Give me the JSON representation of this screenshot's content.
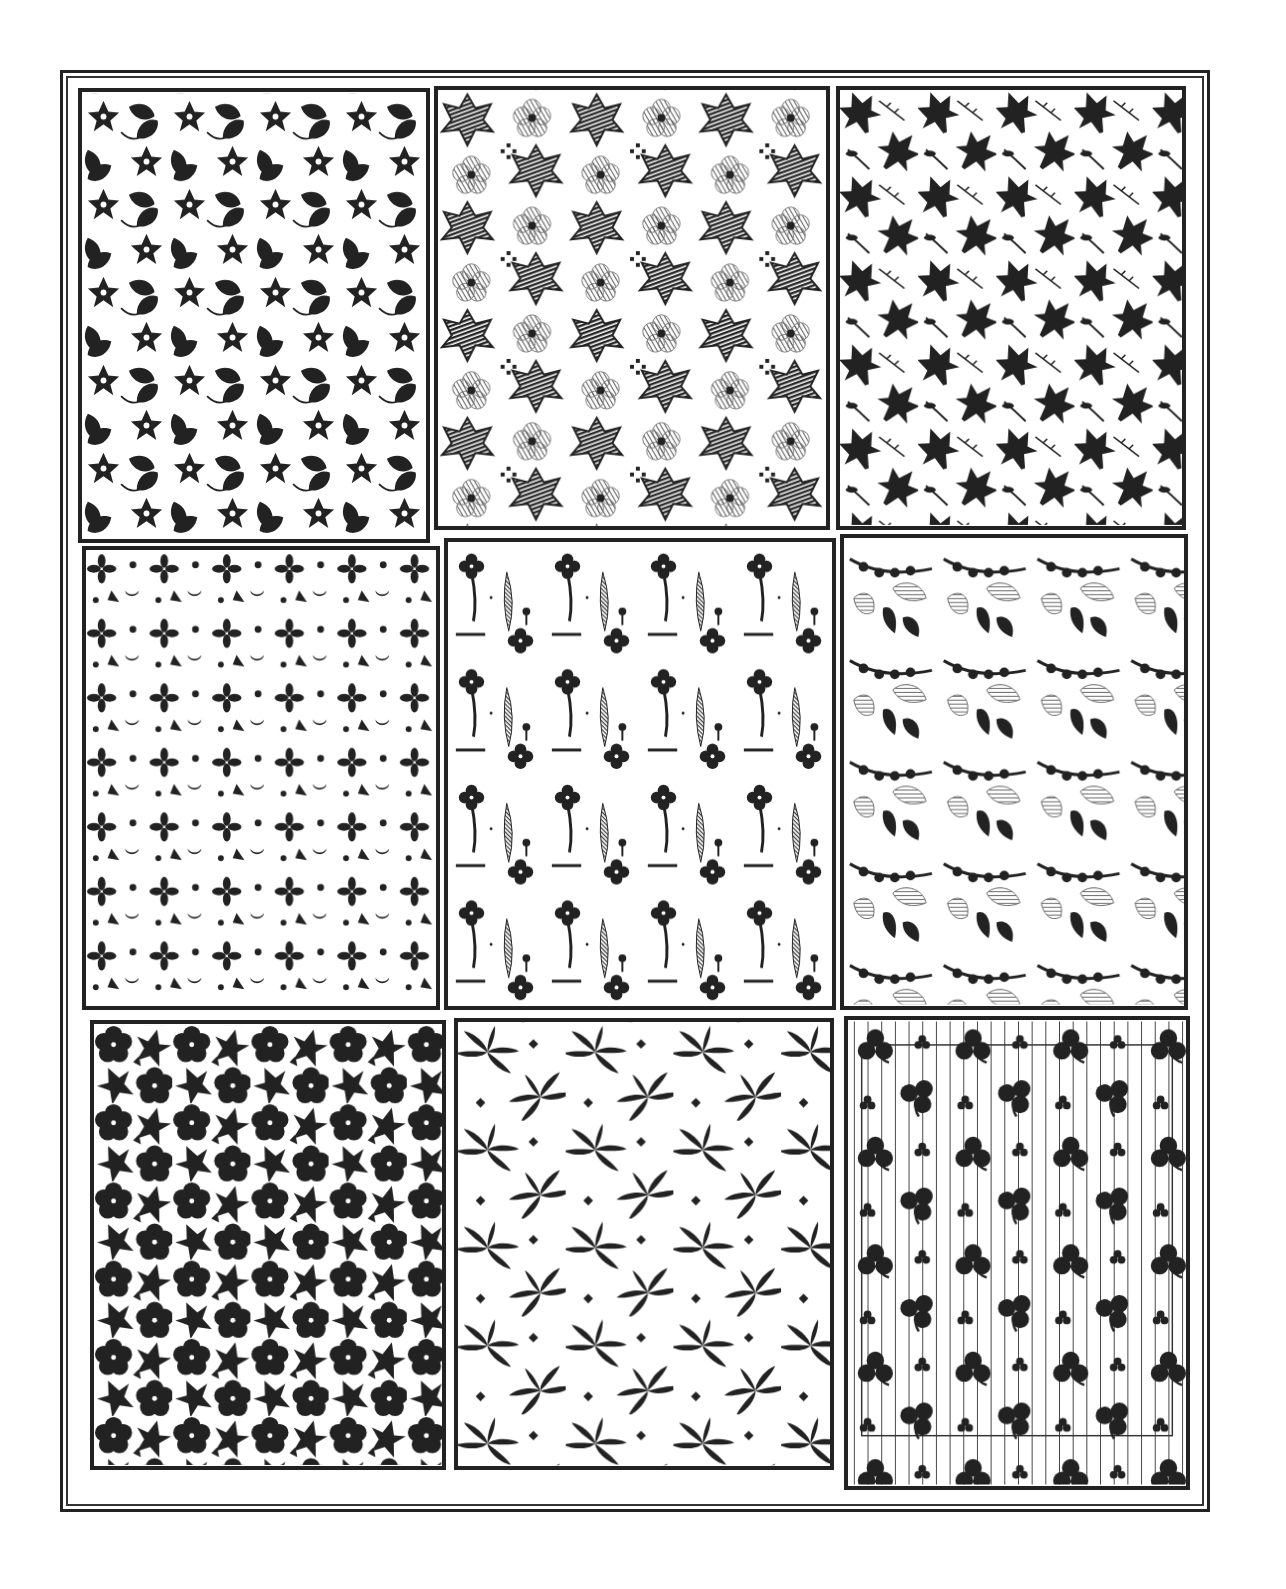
{
  "figure": {
    "title": "",
    "layout": "3x3 grid of printed textile pattern swatches",
    "ink_color": "#222222",
    "paper_color": "#ffffff",
    "panels": [
      {
        "id": 1,
        "row": 1,
        "col": 1,
        "motif": "five-petal flowers and leaves",
        "style": "solid",
        "box": [
          78,
          88,
          352,
          455
        ]
      },
      {
        "id": 2,
        "row": 1,
        "col": 2,
        "motif": "hatched maple leaves and outlined blossoms",
        "style": "hatched",
        "box": [
          434,
          86,
          396,
          444
        ]
      },
      {
        "id": 3,
        "row": 1,
        "col": 3,
        "motif": "maple leaves and thorny sprigs",
        "style": "solid",
        "box": [
          836,
          86,
          350,
          444
        ]
      },
      {
        "id": 4,
        "row": 2,
        "col": 1,
        "motif": "small sprigs, dots and crescents",
        "style": "solid",
        "box": [
          82,
          546,
          358,
          464
        ]
      },
      {
        "id": 5,
        "row": 2,
        "col": 2,
        "motif": "flowers on stems, hatched leaves, dashes",
        "style": "mixed",
        "box": [
          444,
          538,
          392,
          472
        ]
      },
      {
        "id": 6,
        "row": 2,
        "col": 3,
        "motif": "berry vines with hatched leaves",
        "style": "mixed",
        "box": [
          840,
          534,
          348,
          476
        ]
      },
      {
        "id": 7,
        "row": 3,
        "col": 1,
        "motif": "dense flowers and ivy leaves",
        "style": "solid",
        "box": [
          90,
          1020,
          356,
          450
        ]
      },
      {
        "id": 8,
        "row": 3,
        "col": 2,
        "motif": "bamboo leaf clusters and diamonds",
        "style": "solid",
        "box": [
          454,
          1018,
          380,
          452
        ]
      },
      {
        "id": 9,
        "row": 3,
        "col": 3,
        "motif": "clover leaves on vertical stripes",
        "style": "solid on stripes",
        "box": [
          844,
          1016,
          346,
          474
        ]
      }
    ]
  }
}
